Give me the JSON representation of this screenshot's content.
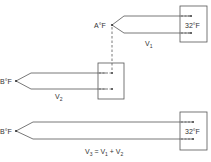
{
  "diagram": {
    "colors": {
      "line": "#555555",
      "text": "#333333",
      "background": "#ffffff"
    },
    "circuits": [
      {
        "id": "circuit-1",
        "hot_junction_label": "A°F",
        "reference_label": "32°F",
        "voltage_label": {
          "main": "V",
          "sub": "1"
        }
      },
      {
        "id": "circuit-2",
        "hot_junction_label": "B°F",
        "reference_label": "",
        "voltage_label": {
          "main": "V",
          "sub": "2"
        }
      },
      {
        "id": "circuit-3",
        "hot_junction_label": "B°F",
        "reference_label": "32°F",
        "voltage_label": {
          "text": "V3 = V1 + V2",
          "parts": [
            "V",
            "3",
            " = V",
            "1",
            " + V",
            "2"
          ]
        }
      }
    ],
    "connector": {
      "style": "dashed",
      "from": "A°F junction",
      "to": "circuit-2 reference box"
    }
  }
}
